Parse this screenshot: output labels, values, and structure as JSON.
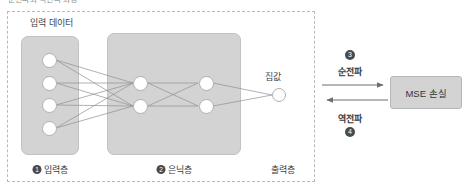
{
  "caption": {
    "top_clipped_text": "순전파와 역전파 과정"
  },
  "network": {
    "input_data_label": "입력 데이터",
    "output_node_label": "집값",
    "layers": [
      {
        "badge": "1",
        "label": "입력층",
        "nodes": 4
      },
      {
        "badge": "2",
        "label": "은닉층",
        "nodes": 4
      },
      {
        "badge": "",
        "label": "출력층",
        "nodes": 1
      }
    ]
  },
  "flow": {
    "forward": {
      "badge": "3",
      "label": "순전파"
    },
    "backward": {
      "badge": "4",
      "label": "역전파"
    }
  },
  "loss": {
    "label": "MSE 손실"
  },
  "colors": {
    "box_fill": "#d3d3d3",
    "box_border": "#c2c2c2",
    "dashed_border": "#b9b9b9",
    "edge": "#8f8f8f",
    "arrow": "#6e6e6e",
    "badge_fill": "#4a4a4a",
    "text": "#3a3a3a",
    "page_bg": "#ffffff"
  }
}
